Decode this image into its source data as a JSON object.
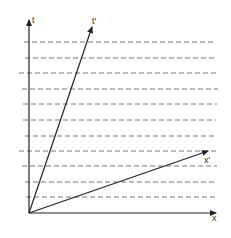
{
  "diagram": {
    "title": "",
    "type": "spacetime-diagram",
    "colors": {
      "axis": "#222222",
      "dashed": "#777777",
      "label": "#333333",
      "background": "#ffffff"
    },
    "origin": {
      "x": 29,
      "y": 213
    },
    "axes": {
      "t": {
        "label": "t",
        "end": {
          "x": 29,
          "y": 20
        },
        "label_pos": {
          "x": 32,
          "y": 16
        }
      },
      "x": {
        "label": "x",
        "end": {
          "x": 216,
          "y": 213
        },
        "label_pos": {
          "x": 212,
          "y": 214
        }
      }
    },
    "boosted_axes": {
      "t_prime": {
        "label": "t'",
        "end": {
          "x": 92,
          "y": 27
        },
        "label_pos": {
          "x": 92,
          "y": 17
        }
      },
      "x_prime": {
        "label": "x'",
        "end": {
          "x": 208,
          "y": 151
        },
        "label_pos": {
          "x": 204,
          "y": 156
        }
      }
    },
    "dashed_lines": [
      {
        "y": 42,
        "x1": 24,
        "x2": 216
      },
      {
        "y": 58,
        "x1": 25,
        "x2": 217
      },
      {
        "y": 73,
        "x1": 19,
        "x2": 216
      },
      {
        "y": 89,
        "x1": 22,
        "x2": 218
      },
      {
        "y": 104,
        "x1": 23,
        "x2": 217
      },
      {
        "y": 120,
        "x1": 23,
        "x2": 216
      },
      {
        "y": 136,
        "x1": 25,
        "x2": 216
      },
      {
        "y": 151,
        "x1": 19,
        "x2": 216
      },
      {
        "y": 166,
        "x1": 22,
        "x2": 217
      },
      {
        "y": 182,
        "x1": 25,
        "x2": 216
      },
      {
        "y": 197,
        "x1": 26,
        "x2": 216
      }
    ]
  }
}
